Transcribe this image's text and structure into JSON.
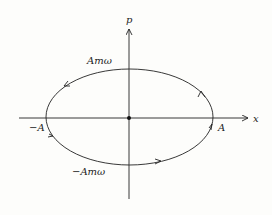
{
  "diagram": {
    "type": "phase-space ellipse",
    "axes": {
      "horizontal_label": "x",
      "vertical_label": "p"
    },
    "labels": {
      "top": "Amω",
      "bottom": "−Amω",
      "left": "−A",
      "right": "A"
    },
    "orientation": "clockwise",
    "colors": {
      "stroke": "#222222",
      "background": "#fdfdfb"
    }
  }
}
